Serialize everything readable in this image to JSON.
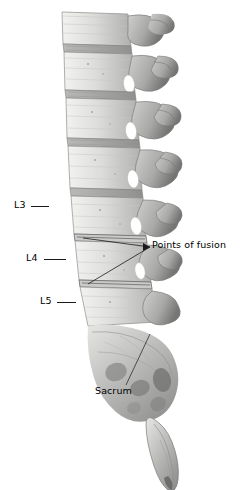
{
  "figure": {
    "background_color": "#ffffff",
    "ink_color": "#000000",
    "bone_tone_light": "#e8e8e6",
    "bone_tone_mid": "#bcbcba",
    "bone_tone_dark": "#8a8a88",
    "bone_tone_shadow": "#5e5e5c"
  },
  "annotations": {
    "l3": {
      "label": "L3"
    },
    "l4": {
      "label": "L4"
    },
    "l5": {
      "label": "L5"
    },
    "fusion": {
      "label": "Points of fusion"
    },
    "sacrum": {
      "label": "Sacrum"
    }
  }
}
